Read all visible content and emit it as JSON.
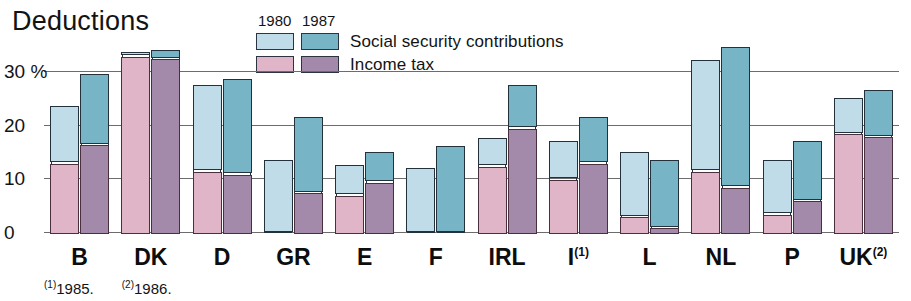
{
  "title": "Deductions",
  "legend": {
    "year_1980": "1980",
    "year_1987": "1987",
    "series": [
      {
        "name": "Social security contributions",
        "color_1980": "#bfdce8",
        "color_1987": "#77b4c6"
      },
      {
        "name": "Income tax",
        "color_1980": "#e0b5c8",
        "color_1987": "#a38aab"
      }
    ]
  },
  "footnotes": [
    {
      "marker": "1",
      "text": "1985."
    },
    {
      "marker": "2",
      "text": "1986."
    }
  ],
  "chart_data": {
    "type": "bar",
    "title": "Deductions",
    "xlabel": "",
    "ylabel": "%",
    "ylim": [
      0,
      36
    ],
    "yticks": [
      0,
      10,
      20,
      30
    ],
    "ytick_labels": [
      "0",
      "10",
      "20",
      "30 %"
    ],
    "grid": true,
    "legend_position": "top-center",
    "stacked": true,
    "categories": [
      "B",
      "DK",
      "D",
      "GR",
      "E",
      "F",
      "IRL",
      "I",
      "L",
      "NL",
      "P",
      "UK"
    ],
    "category_footnotes": {
      "I": "1",
      "UK": "2"
    },
    "series": [
      {
        "name": "Income tax",
        "year": "1980",
        "color": "#e0b5c8",
        "values": [
          13.0,
          33.0,
          11.5,
          0.0,
          7.0,
          0.0,
          12.5,
          10.0,
          3.0,
          11.5,
          3.5,
          18.5
        ]
      },
      {
        "name": "Social security contributions",
        "year": "1980",
        "color": "#bfdce8",
        "values": [
          10.5,
          0.5,
          16.0,
          13.5,
          5.5,
          12.0,
          5.0,
          7.0,
          12.0,
          20.5,
          10.0,
          6.5
        ]
      },
      {
        "name": "Income tax",
        "year": "1987",
        "color": "#a38aab",
        "values": [
          16.5,
          32.5,
          11.0,
          7.5,
          9.5,
          0.0,
          19.5,
          13.0,
          1.0,
          8.5,
          6.0,
          18.0
        ]
      },
      {
        "name": "Social security contributions",
        "year": "1987",
        "color": "#77b4c6",
        "values": [
          13.0,
          1.5,
          17.5,
          14.0,
          5.5,
          16.0,
          8.0,
          8.5,
          12.5,
          26.0,
          11.0,
          8.5
        ]
      }
    ],
    "totals_1980": [
      23.5,
      33.5,
      27.5,
      13.5,
      12.5,
      12.0,
      17.5,
      17.0,
      15.0,
      32.0,
      13.5,
      25.0
    ],
    "totals_1987": [
      29.5,
      34.0,
      28.5,
      21.5,
      15.0,
      16.0,
      27.5,
      21.5,
      13.5,
      34.5,
      17.0,
      26.5
    ]
  }
}
